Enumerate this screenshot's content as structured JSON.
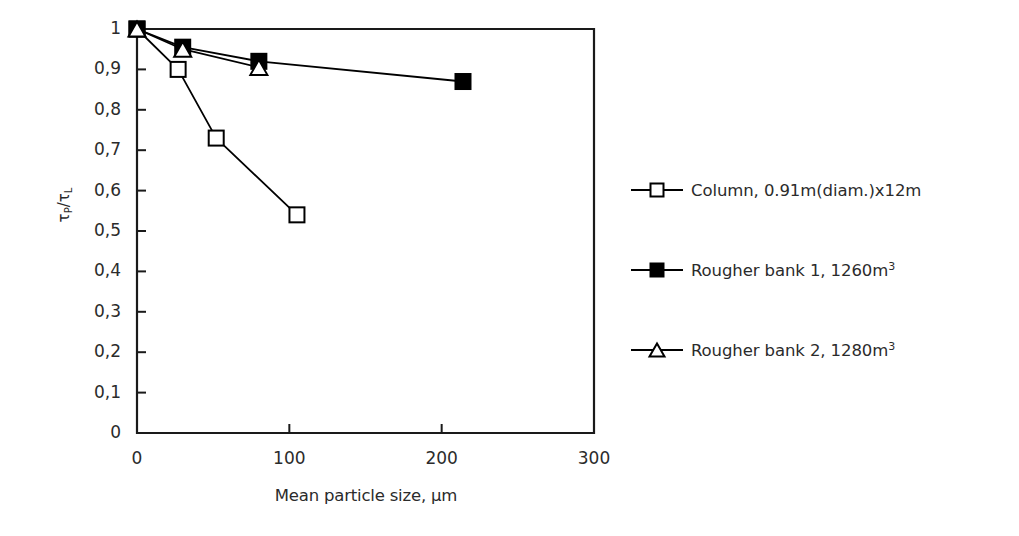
{
  "chart_data": {
    "type": "line",
    "title": "",
    "xlabel": "Mean particle size, µm",
    "ylabel": "τP/τL",
    "ylabel_parts": {
      "tau1": "τ",
      "sub1": "P",
      "slash": "/",
      "tau2": "τ",
      "sub2": "L"
    },
    "xlim": [
      0,
      300
    ],
    "ylim": [
      0,
      1
    ],
    "xticks": [
      0,
      100,
      200,
      300
    ],
    "xtick_labels": [
      "0",
      "100",
      "200",
      "300"
    ],
    "yticks": [
      0,
      0.1,
      0.2,
      0.3,
      0.4,
      0.5,
      0.6,
      0.7,
      0.8,
      0.9,
      1
    ],
    "ytick_labels": [
      "0",
      "0,1",
      "0,2",
      "0,3",
      "0,4",
      "0,5",
      "0,6",
      "0,7",
      "0,8",
      "0,9",
      "1"
    ],
    "grid": false,
    "legend_position": "right",
    "series": [
      {
        "name": "Column, 0.91m(diam.)x12m",
        "marker": "open-square",
        "color": "#000000",
        "x": [
          0,
          27,
          52,
          105
        ],
        "y": [
          1.0,
          0.9,
          0.73,
          0.54
        ]
      },
      {
        "name": "Rougher bank 1, 1260m3",
        "name_base": "Rougher bank 1, 1260m",
        "name_sup": "3",
        "marker": "filled-square",
        "color": "#000000",
        "x": [
          0,
          30,
          80,
          214
        ],
        "y": [
          1.0,
          0.955,
          0.92,
          0.87
        ]
      },
      {
        "name": "Rougher bank 2, 1280m3",
        "name_base": "Rougher bank 2, 1280m",
        "name_sup": "3",
        "marker": "open-triangle",
        "color": "#000000",
        "x": [
          0,
          30,
          80
        ],
        "y": [
          1.0,
          0.95,
          0.905
        ]
      }
    ]
  },
  "legend": {
    "items": [
      {
        "label_base": "Column, 0.91m(diam.)x12m",
        "label_sup": "",
        "marker": "open-square"
      },
      {
        "label_base": "Rougher bank 1, 1260m",
        "label_sup": "3",
        "marker": "filled-square"
      },
      {
        "label_base": "Rougher bank 2, 1280m",
        "label_sup": "3",
        "marker": "open-triangle"
      }
    ]
  },
  "axes": {
    "x_title": "Mean particle size, µm",
    "plot_left": 137,
    "plot_right": 594,
    "plot_top": 29,
    "plot_bottom": 433
  }
}
